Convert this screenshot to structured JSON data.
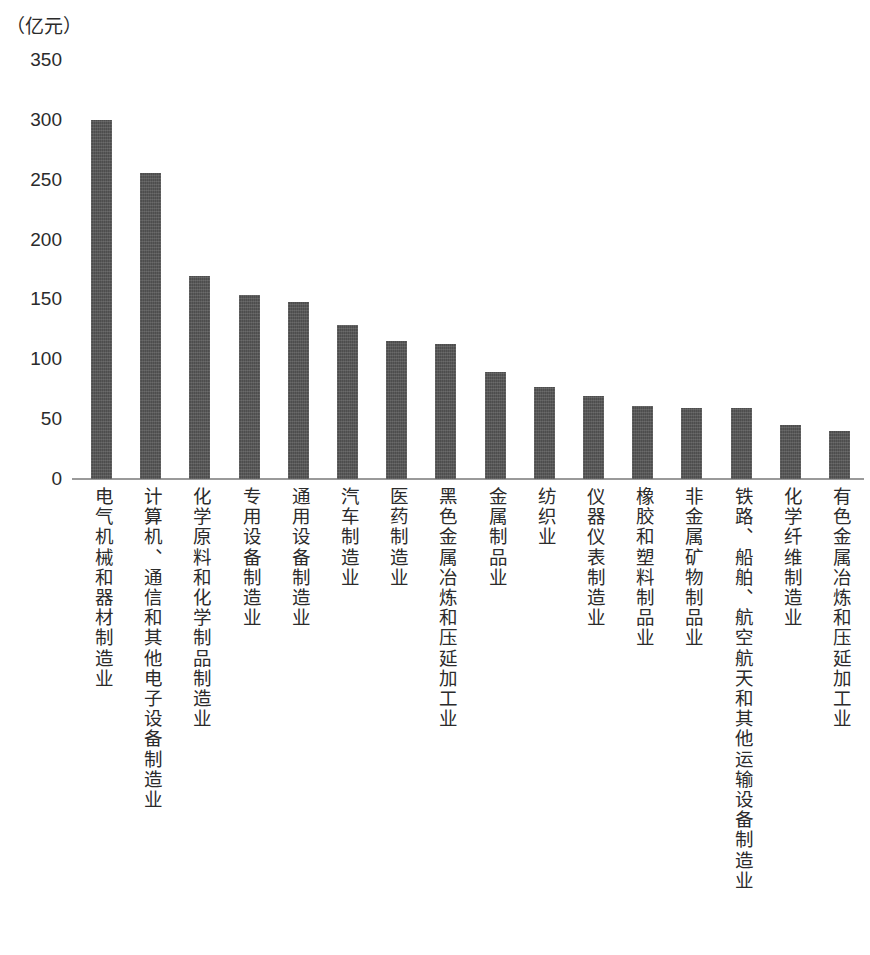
{
  "unit_label": "（亿元）",
  "chart_data": {
    "type": "bar",
    "title": "",
    "subtitle": "",
    "xlabel": "",
    "ylabel": "（亿元）",
    "ylim": [
      0,
      350
    ],
    "yticks": [
      0,
      50,
      100,
      150,
      200,
      250,
      300,
      350
    ],
    "ytick_labels": [
      "0",
      "50",
      "100",
      "150",
      "200",
      "250",
      "300",
      "350"
    ],
    "grid": false,
    "legend": null,
    "bar_color": "#4d4d4d",
    "categories": [
      "电气机械和器材制造业",
      "计算机、通信和其他电子设备制造业",
      "化学原料和化学制品制造业",
      "专用设备制造业",
      "通用设备制造业",
      "汽车制造业",
      "医药制造业",
      "黑色金属冶炼和压延加工业",
      "金属制品业",
      "纺织业",
      "仪器仪表制造业",
      "橡胶和塑料制品业",
      "非金属矿物制品业",
      "铁路、船舶、航空航天和其他运输设备制造业",
      "化学纤维制造业",
      "有色金属冶炼和压延加工业"
    ],
    "values": [
      300,
      256,
      170,
      154,
      148,
      129,
      115,
      113,
      89,
      77,
      69,
      61,
      59,
      59,
      45,
      40
    ]
  }
}
